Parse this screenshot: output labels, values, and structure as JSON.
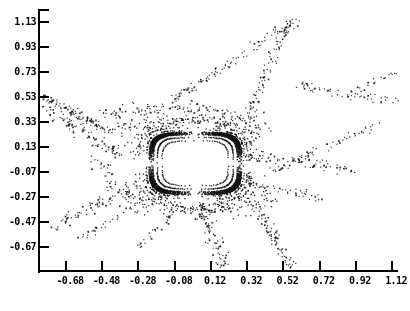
{
  "chart_data": {
    "type": "scatter",
    "title": "",
    "xlabel": "",
    "ylabel": "",
    "background": "#ffffff",
    "axis_color": "#000000",
    "point_color": "#111111",
    "x_tick_labels": [
      "-0.68",
      "-0.48",
      "-0.28",
      "-0.08",
      "0.12",
      "0.32",
      "0.52",
      "0.72",
      "0.92",
      "1.12"
    ],
    "y_tick_labels": [
      "1.13",
      "0.93",
      "0.73",
      "0.53",
      "0.33",
      "0.13",
      "-0.07",
      "-0.27",
      "-0.47",
      "-0.67"
    ],
    "xlim": [
      -0.83,
      1.17
    ],
    "ylim": [
      -0.87,
      1.23
    ],
    "grid": false,
    "legend": null,
    "seed": 20240717,
    "island": {
      "center": [
        0.03,
        0.005
      ],
      "rx": 0.253,
      "ry": 0.248,
      "exp": 4.2,
      "rings": [
        [
          1.0,
          310,
          1.6
        ],
        [
          0.973,
          300,
          1.5
        ],
        [
          0.946,
          290,
          1.5
        ],
        [
          0.919,
          280,
          1.4
        ],
        [
          0.83,
          180,
          1.4
        ],
        [
          0.72,
          95,
          1.3
        ]
      ]
    },
    "halo": [
      [
        1.06,
        150,
        1.2,
        4.2
      ],
      [
        1.13,
        120,
        2.0,
        4.4
      ],
      [
        1.21,
        100,
        3.2,
        4.7
      ],
      [
        1.3,
        85,
        4.5,
        5.0
      ],
      [
        1.41,
        70,
        6.5,
        5.4
      ],
      [
        1.54,
        58,
        9.0,
        5.8
      ],
      [
        1.68,
        46,
        12.0,
        6.2
      ]
    ],
    "streams": [
      {
        "p": [
          [
            -0.83,
            0.57
          ],
          [
            -0.62,
            0.38
          ],
          [
            -0.4,
            0.24
          ]
        ],
        "n": 110,
        "sp": 0.05,
        "bias": 1.0
      },
      {
        "p": [
          [
            -0.8,
            0.44
          ],
          [
            -0.58,
            0.25
          ],
          [
            -0.36,
            0.07
          ]
        ],
        "n": 85,
        "sp": 0.075,
        "bias": 1.0
      },
      {
        "p": [
          [
            -0.48,
            0.4
          ],
          [
            -0.1,
            0.52
          ],
          [
            0.28,
            0.4
          ]
        ],
        "n": 100,
        "sp": 0.085,
        "bias": 1.0
      },
      {
        "p": [
          [
            -0.1,
            0.52
          ],
          [
            0.22,
            0.8
          ],
          [
            0.6,
            1.15
          ]
        ],
        "n": 100,
        "sp": 0.05,
        "bias": 1.0
      },
      {
        "p": [
          [
            0.55,
            1.13
          ],
          [
            0.42,
            0.76
          ],
          [
            0.32,
            0.34
          ]
        ],
        "n": 85,
        "sp": 0.05,
        "bias": 1.0
      },
      {
        "p": [
          [
            0.58,
            0.64
          ],
          [
            0.88,
            0.54
          ],
          [
            1.15,
            0.5
          ]
        ],
        "n": 55,
        "sp": 0.05,
        "bias": 1.0
      },
      {
        "p": [
          [
            0.93,
            0.6
          ],
          [
            1.04,
            0.67
          ],
          [
            1.14,
            0.73
          ]
        ],
        "n": 18,
        "sp": 0.03,
        "bias": 1.0
      },
      {
        "p": [
          [
            0.45,
            -0.05
          ],
          [
            0.75,
            0.12
          ],
          [
            1.06,
            0.33
          ]
        ],
        "n": 60,
        "sp": 0.05,
        "bias": 1.0
      },
      {
        "p": [
          [
            0.31,
            0.06
          ],
          [
            0.58,
            0.03
          ],
          [
            0.9,
            -0.05
          ]
        ],
        "n": 75,
        "sp": 0.07,
        "bias": 1.5
      },
      {
        "p": [
          [
            0.31,
            -0.14
          ],
          [
            0.52,
            -0.22
          ],
          [
            0.74,
            -0.28
          ]
        ],
        "n": 55,
        "sp": 0.05,
        "bias": 1.3
      },
      {
        "p": [
          [
            0.36,
            -0.32
          ],
          [
            0.46,
            -0.57
          ],
          [
            0.57,
            -0.88
          ]
        ],
        "n": 85,
        "sp": 0.055,
        "bias": 1.0
      },
      {
        "p": [
          [
            0.06,
            -0.32
          ],
          [
            0.11,
            -0.56
          ],
          [
            0.2,
            -0.86
          ]
        ],
        "n": 95,
        "sp": 0.07,
        "bias": 1.1
      },
      {
        "p": [
          [
            -0.06,
            -0.33
          ],
          [
            -0.15,
            -0.5
          ],
          [
            -0.28,
            -0.66
          ]
        ],
        "n": 32,
        "sp": 0.05,
        "bias": 1.0
      },
      {
        "p": [
          [
            -0.75,
            -0.5
          ],
          [
            -0.52,
            -0.33
          ],
          [
            -0.32,
            -0.2
          ]
        ],
        "n": 70,
        "sp": 0.06,
        "bias": 1.0
      },
      {
        "p": [
          [
            -0.6,
            -0.6
          ],
          [
            -0.45,
            -0.46
          ],
          [
            -0.31,
            -0.34
          ]
        ],
        "n": 28,
        "sp": 0.04,
        "bias": 1.0
      },
      {
        "p": [
          [
            -0.18,
            0.3
          ],
          [
            0.02,
            0.4
          ],
          [
            0.22,
            0.31
          ]
        ],
        "n": 70,
        "sp": 0.05,
        "bias": 1.0
      },
      {
        "p": [
          [
            -0.14,
            -0.31
          ],
          [
            0.03,
            -0.43
          ],
          [
            0.22,
            -0.33
          ]
        ],
        "n": 65,
        "sp": 0.05,
        "bias": 1.0
      },
      {
        "p": [
          [
            -0.5,
            0.05
          ],
          [
            -0.45,
            -0.08
          ],
          [
            -0.42,
            -0.2
          ]
        ],
        "n": 30,
        "sp": 0.07,
        "bias": 1.0
      }
    ]
  }
}
